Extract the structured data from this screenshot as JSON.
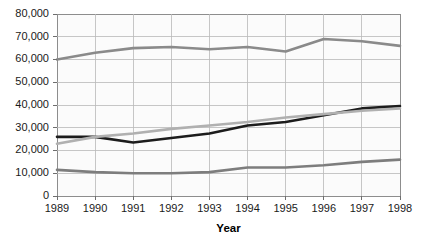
{
  "chart_data": {
    "type": "line",
    "title": "",
    "subtitle": "",
    "xlabel": "Year",
    "ylabel": "",
    "categories": [
      "1989",
      "1990",
      "1991",
      "1992",
      "1993",
      "1994",
      "1995",
      "1996",
      "1997",
      "1998"
    ],
    "x": [
      1989,
      1990,
      1991,
      1992,
      1993,
      1994,
      1995,
      1996,
      1997,
      1998
    ],
    "ylim": [
      0,
      80000
    ],
    "xlim": [
      1989,
      1998
    ],
    "ytick_labels": [
      "0",
      "10,000",
      "20,000",
      "30,000",
      "40,000",
      "50,000",
      "60,000",
      "70,000",
      "80,000"
    ],
    "ytick_values": [
      0,
      10000,
      20000,
      30000,
      40000,
      50000,
      60000,
      70000,
      80000
    ],
    "grid": true,
    "grid_axis": "both",
    "legend": false,
    "legend_position": "none",
    "annotations": [],
    "series": [
      {
        "name": "series-1-top",
        "color": "#8a8a8a",
        "width": 2.6,
        "values": [
          60000,
          63000,
          65000,
          65500,
          64500,
          65500,
          63500,
          69000,
          68000,
          66000
        ]
      },
      {
        "name": "series-2-dark",
        "color": "#1c1c1c",
        "width": 2.6,
        "values": [
          26000,
          26000,
          23500,
          25500,
          27500,
          31000,
          32500,
          35500,
          38500,
          39500
        ]
      },
      {
        "name": "series-3-light",
        "color": "#b0b0b0",
        "width": 2.6,
        "values": [
          23000,
          26000,
          27500,
          29500,
          31000,
          32500,
          34500,
          36000,
          37500,
          38500
        ]
      },
      {
        "name": "series-4-bottom",
        "color": "#7d7d7d",
        "width": 2.6,
        "values": [
          11500,
          10500,
          10000,
          10000,
          10500,
          12500,
          12500,
          13500,
          15000,
          16000
        ]
      }
    ]
  },
  "layout": {
    "plot_left": 57,
    "plot_right": 400,
    "plot_top": 14,
    "plot_bottom": 196,
    "xaxis_title_y": 224
  },
  "colors": {
    "plot_background": "#fbfbfb",
    "page_background": "#ffffff",
    "gridline": "#b9b9b9",
    "frame": "#8d8d8d",
    "tick_text": "#1a1a1a",
    "axis_title": "#000000"
  }
}
